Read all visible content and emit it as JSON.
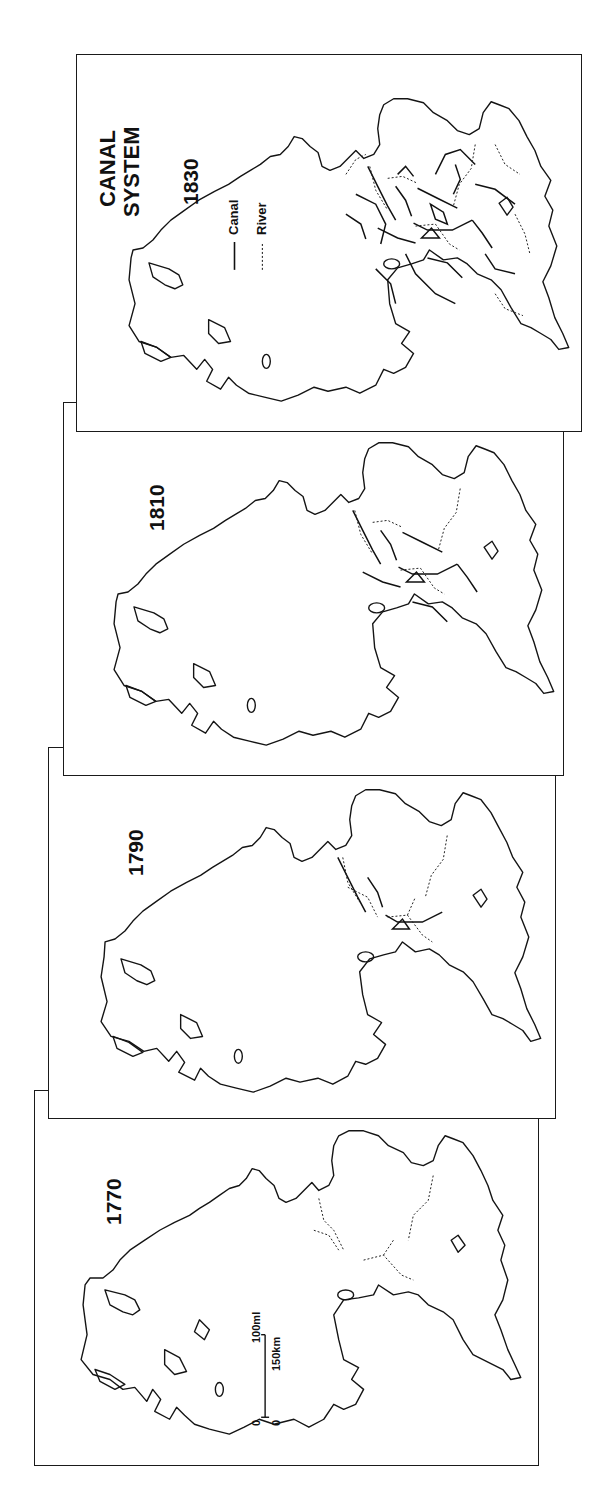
{
  "figure": {
    "title_line1": "CANAL",
    "title_line2": "SYSTEM",
    "orientation": "rotated 90° counter-clockwise",
    "legend": {
      "canal_label": "Canal",
      "canal_symbol": "solid line",
      "river_label": "River",
      "river_symbol": "dotted line"
    },
    "scale": {
      "zero_mi": "0",
      "zero_km": "0",
      "miles_label": "100ml",
      "km_label": "150km"
    }
  },
  "panels": [
    {
      "year": "1830",
      "position": "top",
      "network_density": "dense canal network"
    },
    {
      "year": "1810",
      "position": "second",
      "network_density": "moderate canal network"
    },
    {
      "year": "1790",
      "position": "third",
      "network_density": "early canal network"
    },
    {
      "year": "1770",
      "position": "bottom",
      "network_density": "few canals, mostly rivers"
    }
  ],
  "colors": {
    "ink": "#141414",
    "paper": "#ffffff"
  }
}
